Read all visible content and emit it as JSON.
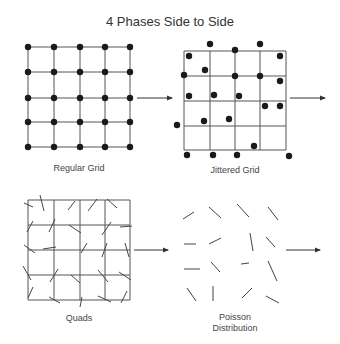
{
  "title": "4 Phases Side to Side",
  "panels": [
    {
      "id": "regular-grid",
      "label": "Regular Grid",
      "grid": {
        "x": [
          28,
          54,
          80,
          105,
          130
        ],
        "y": [
          47,
          72,
          98,
          122,
          147
        ]
      },
      "dots": [
        [
          28,
          47
        ],
        [
          54,
          47
        ],
        [
          80,
          47
        ],
        [
          105,
          47
        ],
        [
          130,
          47
        ],
        [
          28,
          72
        ],
        [
          54,
          72
        ],
        [
          80,
          72
        ],
        [
          105,
          72
        ],
        [
          130,
          72
        ],
        [
          28,
          98
        ],
        [
          54,
          98
        ],
        [
          80,
          98
        ],
        [
          105,
          98
        ],
        [
          130,
          98
        ],
        [
          28,
          122
        ],
        [
          54,
          122
        ],
        [
          80,
          122
        ],
        [
          105,
          122
        ],
        [
          130,
          122
        ],
        [
          28,
          147
        ],
        [
          54,
          147
        ],
        [
          80,
          147
        ],
        [
          105,
          147
        ],
        [
          130,
          147
        ]
      ]
    },
    {
      "id": "jittered-grid",
      "label": "Jittered Grid",
      "grid": {
        "x": [
          184,
          210,
          235,
          260,
          286
        ],
        "y": [
          51,
          76,
          101,
          126,
          150
        ]
      },
      "dots": [
        [
          210,
          44
        ],
        [
          260,
          44
        ],
        [
          235,
          50
        ],
        [
          189,
          56
        ],
        [
          280,
          56
        ],
        [
          205,
          70
        ],
        [
          184,
          75
        ],
        [
          235,
          76
        ],
        [
          260,
          76
        ],
        [
          280,
          81
        ],
        [
          189,
          96
        ],
        [
          214,
          95
        ],
        [
          239,
          96
        ],
        [
          265,
          106
        ],
        [
          280,
          106
        ],
        [
          177,
          125
        ],
        [
          204,
          121
        ],
        [
          229,
          119
        ],
        [
          254,
          146
        ],
        [
          187,
          155
        ],
        [
          213,
          155
        ],
        [
          237,
          155
        ],
        [
          289,
          156
        ]
      ]
    },
    {
      "id": "quads",
      "label": "Quads",
      "grid": {
        "x": [
          28,
          54,
          80,
          105,
          130
        ],
        "y": [
          200,
          225,
          250,
          275,
          300
        ]
      },
      "strokes": [
        [
          24,
          203,
          33,
          207
        ],
        [
          40,
          195,
          44,
          211
        ],
        [
          68,
          210,
          75,
          201
        ],
        [
          88,
          211,
          97,
          199
        ],
        [
          107,
          199,
          117,
          208
        ],
        [
          27,
          232,
          33,
          221
        ],
        [
          49,
          232,
          55,
          219
        ],
        [
          69,
          225,
          81,
          233
        ],
        [
          102,
          235,
          111,
          222
        ],
        [
          120,
          227,
          132,
          226
        ],
        [
          24,
          245,
          35,
          253
        ],
        [
          43,
          249,
          56,
          247
        ],
        [
          81,
          253,
          87,
          243
        ],
        [
          102,
          257,
          107,
          243
        ],
        [
          125,
          243,
          129,
          257
        ],
        [
          23,
          266,
          31,
          280
        ],
        [
          50,
          282,
          58,
          269
        ],
        [
          71,
          275,
          80,
          283
        ],
        [
          98,
          270,
          108,
          282
        ],
        [
          119,
          272,
          131,
          280
        ],
        [
          28,
          298,
          33,
          287
        ],
        [
          49,
          297,
          60,
          303
        ],
        [
          80,
          307,
          82,
          297
        ],
        [
          98,
          296,
          111,
          302
        ],
        [
          121,
          303,
          127,
          291
        ]
      ]
    },
    {
      "id": "poisson-distribution",
      "label_line1": "Poisson",
      "label_line2": "Distribution",
      "strokes": [
        [
          183,
          219,
          194,
          212
        ],
        [
          209,
          207,
          221,
          218
        ],
        [
          237,
          204,
          249,
          217
        ],
        [
          268,
          207,
          278,
          220
        ],
        [
          184,
          244,
          196,
          244
        ],
        [
          209,
          244,
          221,
          238
        ],
        [
          250,
          233,
          253,
          251
        ],
        [
          266,
          237,
          275,
          247
        ],
        [
          184,
          269,
          200,
          269
        ],
        [
          211,
          262,
          220,
          272
        ],
        [
          241,
          264,
          249,
          263
        ],
        [
          268,
          261,
          277,
          281
        ],
        [
          187,
          288,
          196,
          301
        ],
        [
          213,
          286,
          213,
          301
        ],
        [
          242,
          298,
          252,
          288
        ],
        [
          266,
          296,
          279,
          303
        ]
      ]
    }
  ],
  "arrows": [
    {
      "id": "regular-to-jittered",
      "x1": 137,
      "y1": 98,
      "x2": 172,
      "y2": 98
    },
    {
      "id": "jittered-out",
      "x1": 290,
      "y1": 98,
      "x2": 325,
      "y2": 98
    },
    {
      "id": "quads-to-poisson",
      "x1": 134,
      "y1": 250,
      "x2": 168,
      "y2": 250
    },
    {
      "id": "poisson-out",
      "x1": 286,
      "y1": 250,
      "x2": 320,
      "y2": 250
    }
  ],
  "colors": {
    "ink": "#1a1a1a",
    "grid": "#555555",
    "stroke": "#444444",
    "background": "#ffffff"
  }
}
